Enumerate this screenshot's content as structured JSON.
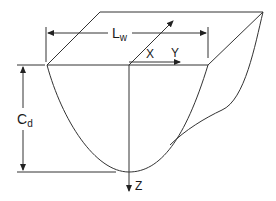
{
  "diagram": {
    "type": "paraboloid-basin-schematic",
    "labels": {
      "width_main": "L",
      "width_sub": "w",
      "depth_main": "C",
      "depth_sub": "d",
      "axis_x": "X",
      "axis_y": "Y",
      "axis_z": "Z"
    },
    "colors": {
      "line": "#333333",
      "background": "#ffffff"
    }
  }
}
